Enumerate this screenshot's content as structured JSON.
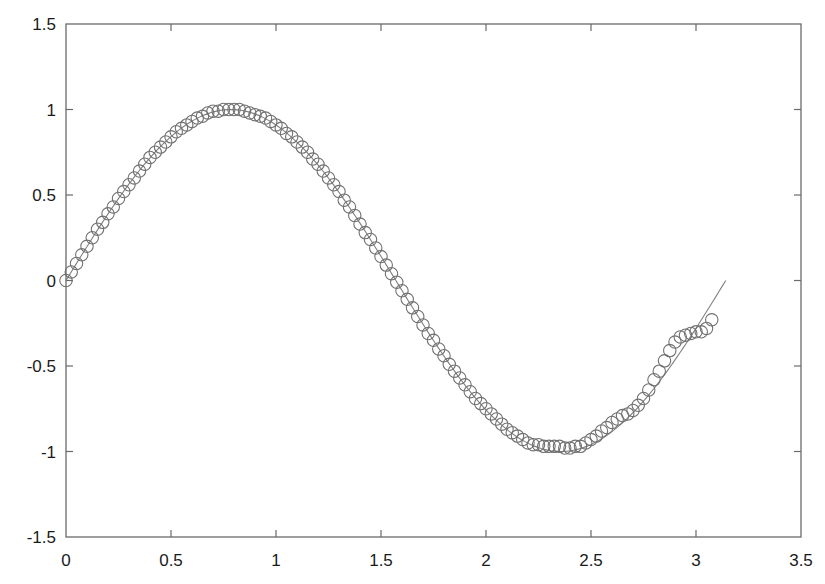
{
  "chart_data": {
    "type": "scatter",
    "title": "",
    "xlabel": "",
    "ylabel": "",
    "xlim": [
      0,
      3.5
    ],
    "ylim": [
      -1.5,
      1.5
    ],
    "grid": false,
    "legend": null,
    "xticks": [
      "0",
      "0.5",
      "1",
      "1.5",
      "2",
      "2.5",
      "3",
      "3.5"
    ],
    "yticks": [
      "1.5",
      "1",
      "0.5",
      "0",
      "-0.5",
      "-1",
      "-1.5"
    ],
    "series": [
      {
        "name": "samples",
        "style": "open-circle-markers",
        "color": "#707070",
        "x": [
          0.0,
          0.025,
          0.05,
          0.075,
          0.1,
          0.125,
          0.15,
          0.175,
          0.2,
          0.225,
          0.25,
          0.275,
          0.3,
          0.325,
          0.35,
          0.375,
          0.4,
          0.425,
          0.45,
          0.475,
          0.5,
          0.525,
          0.55,
          0.575,
          0.6,
          0.625,
          0.65,
          0.675,
          0.7,
          0.725,
          0.75,
          0.775,
          0.8,
          0.825,
          0.85,
          0.875,
          0.9,
          0.925,
          0.95,
          0.975,
          1.0,
          1.025,
          1.05,
          1.075,
          1.1,
          1.125,
          1.15,
          1.175,
          1.2,
          1.225,
          1.25,
          1.275,
          1.3,
          1.325,
          1.35,
          1.375,
          1.4,
          1.425,
          1.45,
          1.475,
          1.5,
          1.525,
          1.55,
          1.575,
          1.6,
          1.625,
          1.65,
          1.675,
          1.7,
          1.725,
          1.75,
          1.775,
          1.8,
          1.825,
          1.85,
          1.875,
          1.9,
          1.925,
          1.95,
          1.975,
          2.0,
          2.025,
          2.05,
          2.075,
          2.1,
          2.125,
          2.15,
          2.175,
          2.2,
          2.225,
          2.25,
          2.275,
          2.3,
          2.325,
          2.35,
          2.375,
          2.4,
          2.425,
          2.45,
          2.475,
          2.5,
          2.525,
          2.55,
          2.575,
          2.6,
          2.625,
          2.65,
          2.675,
          2.7,
          2.725,
          2.75,
          2.775,
          2.8,
          2.825,
          2.85,
          2.875,
          2.9,
          2.925,
          2.95,
          2.975,
          3.0,
          3.025,
          3.05,
          3.075
        ],
        "y": [
          0.0,
          0.05,
          0.1,
          0.15,
          0.2,
          0.25,
          0.3,
          0.34,
          0.39,
          0.43,
          0.48,
          0.52,
          0.56,
          0.6,
          0.64,
          0.68,
          0.72,
          0.75,
          0.78,
          0.81,
          0.84,
          0.87,
          0.89,
          0.91,
          0.93,
          0.95,
          0.96,
          0.98,
          0.99,
          0.99,
          1.0,
          1.0,
          1.0,
          1.0,
          0.99,
          0.98,
          0.97,
          0.96,
          0.95,
          0.93,
          0.91,
          0.89,
          0.86,
          0.84,
          0.81,
          0.78,
          0.75,
          0.71,
          0.68,
          0.64,
          0.6,
          0.56,
          0.52,
          0.47,
          0.43,
          0.38,
          0.33,
          0.28,
          0.24,
          0.19,
          0.14,
          0.09,
          0.04,
          -0.01,
          -0.06,
          -0.11,
          -0.16,
          -0.21,
          -0.26,
          -0.31,
          -0.35,
          -0.4,
          -0.44,
          -0.49,
          -0.53,
          -0.57,
          -0.61,
          -0.65,
          -0.69,
          -0.72,
          -0.75,
          -0.78,
          -0.81,
          -0.84,
          -0.87,
          -0.89,
          -0.91,
          -0.93,
          -0.95,
          -0.96,
          -0.96,
          -0.97,
          -0.97,
          -0.97,
          -0.97,
          -0.98,
          -0.98,
          -0.97,
          -0.97,
          -0.95,
          -0.93,
          -0.91,
          -0.88,
          -0.86,
          -0.83,
          -0.81,
          -0.79,
          -0.78,
          -0.76,
          -0.73,
          -0.69,
          -0.64,
          -0.58,
          -0.53,
          -0.47,
          -0.41,
          -0.36,
          -0.33,
          -0.32,
          -0.31,
          -0.3,
          -0.3,
          -0.28,
          -0.23
        ]
      },
      {
        "name": "reference",
        "style": "solid-line",
        "color": "#808080",
        "function": "sin(2x)",
        "x_range": [
          0,
          3.1416
        ]
      }
    ]
  }
}
